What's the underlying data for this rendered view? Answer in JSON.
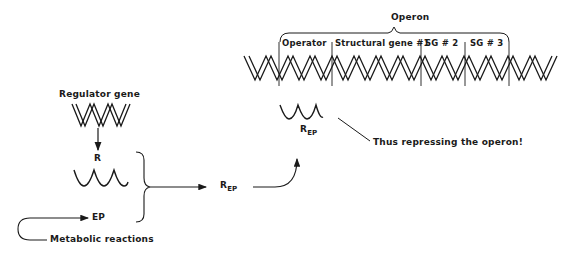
{
  "diagram": {
    "operon": {
      "title": "Operon",
      "segments": [
        {
          "label": "Operator"
        },
        {
          "label": "Structural gene #1"
        },
        {
          "label": "SG # 2"
        },
        {
          "label": "SG # 3"
        }
      ]
    },
    "regulator_gene": {
      "label": "Regulator gene"
    },
    "repressor": {
      "label": "R"
    },
    "effector": {
      "label": "EP"
    },
    "metabolic": {
      "label": "Metabolic reactions"
    },
    "complex": {
      "label_main": "R",
      "label_sub": "EP"
    },
    "bound_complex": {
      "label_main": "R",
      "label_sub": "EP"
    },
    "annotation": {
      "label": "Thus repressing the operon!"
    },
    "colors": {
      "ink": "#1a1a1a",
      "background": "#ffffff"
    }
  }
}
